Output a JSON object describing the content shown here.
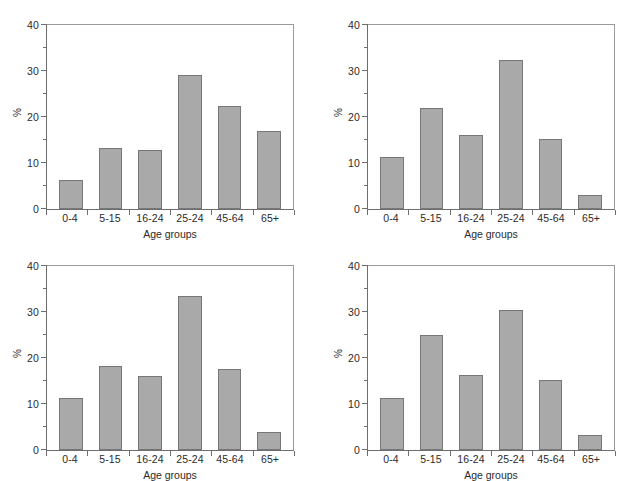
{
  "figure": {
    "background_color": "#ffffff",
    "bar_fill_color": "#a9a9a9",
    "bar_edge_color": "#777777",
    "axis_color": "#6e6e6e"
  },
  "chart_data": [
    {
      "type": "bar",
      "panel_id": "a",
      "title": "a) White",
      "categories": [
        "0-4",
        "5-15",
        "16-24",
        "25-24",
        "45-64",
        "65+"
      ],
      "values": [
        6.3,
        13.2,
        12.8,
        29.2,
        22.4,
        16.9
      ],
      "xlabel": "Age groups",
      "ylabel": "%",
      "ylim": [
        0,
        40
      ],
      "yticks": [
        0,
        10,
        20,
        30,
        40
      ],
      "yticks_minor": [
        5,
        15,
        25,
        35
      ],
      "grid": false,
      "legend": "none"
    },
    {
      "type": "bar",
      "panel_id": "b",
      "title": "b) Black",
      "categories": [
        "0-4",
        "5-15",
        "16-24",
        "25-24",
        "45-64",
        "65+"
      ],
      "values": [
        11.3,
        18.3,
        16.1,
        33.5,
        17.6,
        4.0
      ],
      "xlabel": "Age groups",
      "ylabel": "%",
      "ylim": [
        0,
        40
      ],
      "yticks": [
        0,
        10,
        20,
        30,
        40
      ],
      "yticks_minor": [
        5,
        15,
        25,
        35
      ],
      "grid": false,
      "legend": "none"
    },
    {
      "type": "bar",
      "panel_id": "c",
      "title": "c) All ethnic minorities",
      "categories": [
        "0-4",
        "5-15",
        "16-24",
        "25-24",
        "45-64",
        "65+"
      ],
      "values": [
        11.2,
        22.0,
        16.0,
        32.4,
        15.3,
        3.1
      ],
      "xlabel": "Age groups",
      "ylabel": "%",
      "ylim": [
        0,
        40
      ],
      "yticks": [
        0,
        10,
        20,
        30,
        40
      ],
      "yticks_minor": [
        5,
        15,
        25,
        35
      ],
      "grid": false,
      "legend": "none"
    },
    {
      "type": "bar",
      "panel_id": "d",
      "title": "d) South Asian",
      "categories": [
        "0-4",
        "5-15",
        "16-24",
        "25-24",
        "45-64",
        "65+"
      ],
      "values": [
        11.3,
        25.1,
        16.4,
        30.4,
        15.2,
        3.3
      ],
      "xlabel": "Age groups",
      "ylabel": "%",
      "ylim": [
        0,
        40
      ],
      "yticks": [
        0,
        10,
        20,
        30,
        40
      ],
      "yticks_minor": [
        5,
        15,
        25,
        35
      ],
      "grid": false,
      "legend": "none"
    }
  ]
}
